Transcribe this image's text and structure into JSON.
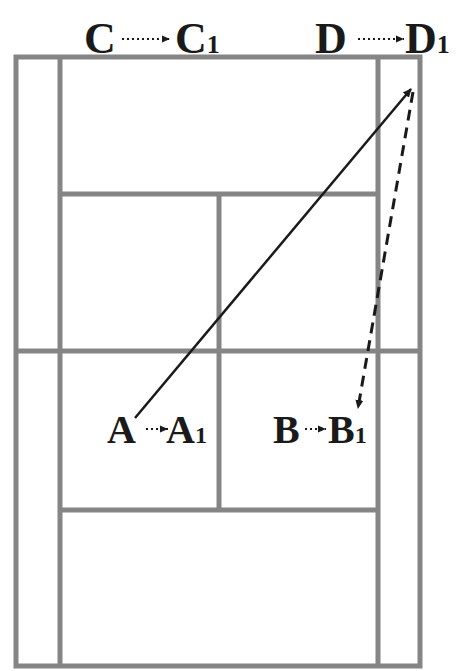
{
  "diagram": {
    "type": "badminton-court-movement",
    "court": {
      "line_color": "#858585",
      "line_width": 5,
      "outer": {
        "x1": 16,
        "y1": 57,
        "x2": 420,
        "y2": 666
      },
      "side_lines_x": [
        60,
        378
      ],
      "short_service_lines_y": [
        194,
        510
      ],
      "net_line_y": 351,
      "center_line": {
        "x": 219,
        "y1": 194,
        "y2": 510
      }
    },
    "paths": [
      {
        "name": "shot-path",
        "style": "solid",
        "from": [
          135,
          418
        ],
        "to": [
          413,
          87
        ],
        "color": "#1a1a1a"
      },
      {
        "name": "return-path",
        "style": "dashed",
        "from": [
          413,
          87
        ],
        "to": [
          357,
          412
        ],
        "color": "#1a1a1a"
      }
    ],
    "labels": {
      "c": {
        "start": "C",
        "end": "C",
        "sub": "1"
      },
      "d": {
        "start": "D",
        "end": "D",
        "sub": "1"
      },
      "a": {
        "start": "A",
        "end": "A",
        "sub": "1"
      },
      "b": {
        "start": "B",
        "end": "B",
        "sub": "1"
      }
    },
    "text_color": "#1a1a1a"
  }
}
